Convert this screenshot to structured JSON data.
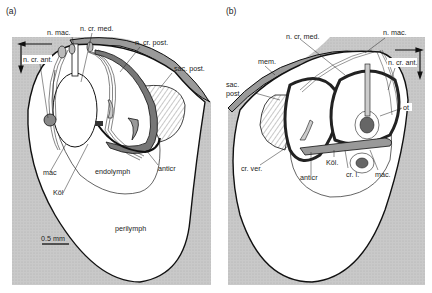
{
  "figure": {
    "panels": [
      {
        "id": "a",
        "panel_label": "(a)",
        "labels": {
          "n_mac": "n. mac.",
          "n_cr_med": "n. cr. med.",
          "n_cr_post": "n. cr. post.",
          "sac_post": "sac. post.",
          "n_cr_ant": "n. cr. ant.",
          "mac": "mac",
          "endolymph": "endolymph",
          "anticr": "anticr",
          "kol": "Köl",
          "perilymph": "perilymph",
          "scale_bar": "0.5 mm"
        }
      },
      {
        "id": "b",
        "panel_label": "(b)",
        "labels": {
          "n_cr_med": "n. cr. med.",
          "n_mac": "n. mac.",
          "mem": "mem.",
          "sac_post_1": "sac.",
          "sac_post_2": "post.",
          "n_cr_ant": "n. cr. ant.",
          "ot": "ot",
          "cr_ver": "cr. ver.",
          "kol": "Köl.",
          "anticr": "anticr",
          "cr_l": "cr. l.",
          "mac": "mac."
        }
      }
    ],
    "colors": {
      "background_grey": "#c4c4c4",
      "outline": "#111111",
      "membrane_grey": "#9a9a9a",
      "fill_white": "#ffffff"
    }
  }
}
